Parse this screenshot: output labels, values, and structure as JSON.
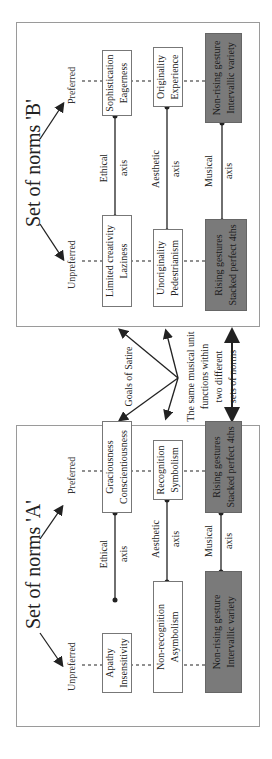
{
  "figure": {
    "orientation": "rotated -90deg (landscape figure shown in portrait)",
    "middle": {
      "goals_label": "Goals of Satire",
      "caption_lines": [
        "The same musical unit",
        "functions within",
        "two different",
        "sets of norms"
      ]
    },
    "panel_a": {
      "title": "Set of norms 'A'",
      "unpreferred_label": "Unpreferred",
      "preferred_label": "Preferred",
      "axes": [
        {
          "name_line1": "Ethical",
          "name_line2": "axis",
          "unpreferred": [
            "Apathy",
            "Insensitivity"
          ],
          "preferred": [
            "Graciousness",
            "Conscientiousness"
          ],
          "musical": false
        },
        {
          "name_line1": "Aesthetic",
          "name_line2": "axis",
          "unpreferred": [
            "Non-recognition",
            "Asymbolism"
          ],
          "preferred": [
            "Recognition",
            "Symbolism"
          ],
          "musical": false
        },
        {
          "name_line1": "Musical",
          "name_line2": "axis",
          "unpreferred": [
            "Non-rising gesture",
            "Intervallic variety"
          ],
          "preferred": [
            "Rising gestures",
            "Stacked perfect 4ths"
          ],
          "musical": true
        }
      ]
    },
    "panel_b": {
      "title": "Set of norms 'B'",
      "unpreferred_label": "Unpreferred",
      "preferred_label": "Preferred",
      "axes": [
        {
          "name_line1": "Ethical",
          "name_line2": "axis",
          "unpreferred": [
            "Limited creativity",
            "Laziness"
          ],
          "preferred": [
            "Sophistication",
            "Eagerness"
          ],
          "musical": false
        },
        {
          "name_line1": "Aesthetic",
          "name_line2": "axis",
          "unpreferred": [
            "Unoriginality",
            "Pedestrianism"
          ],
          "preferred": [
            "Originality",
            "Experience"
          ],
          "musical": false
        },
        {
          "name_line1": "Musical",
          "name_line2": "axis",
          "unpreferred": [
            "Rising gestures",
            "Stacked perfect 4ths"
          ],
          "preferred": [
            "Non-rising gesture",
            "Intervallic variety"
          ],
          "musical": true
        }
      ]
    },
    "colors": {
      "dark_box": "#7a7a7a",
      "line": "#222222",
      "panel_border": "#9a9a9a"
    }
  }
}
